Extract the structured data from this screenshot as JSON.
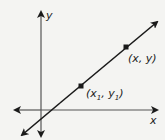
{
  "diagram": {
    "type": "coordinate-plane-line",
    "axes": {
      "x_label": "x",
      "y_label": "y"
    },
    "points": [
      {
        "name": "point-x1-y1",
        "label_main_x": "(x",
        "label_sub_1": "1",
        "label_sep": ", y",
        "label_sub_2": "1",
        "label_end": ")"
      },
      {
        "name": "point-x-y",
        "label": "(x, y)"
      }
    ],
    "colors": {
      "line": "#1a1a1a",
      "background": "#f4f4f2",
      "text": "#222222"
    }
  }
}
